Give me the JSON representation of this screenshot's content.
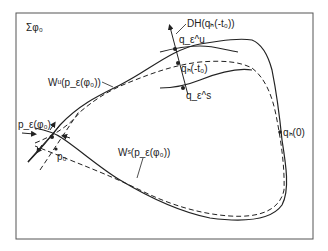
{
  "figure": {
    "section_label": "Σφ₀",
    "labels": {
      "dh": "DH(qₕ(-t₀))",
      "q_eps_u": "q_ε^u",
      "q_h_minus_t0": "qₕ(-t₀)",
      "q_eps_s": "q_ε^s",
      "w_unstable": "Wᵘ(p_ε(φ₀))",
      "w_stable": "Wˢ(p_ε(φ₀))",
      "p_eps": "p_ε(φ₀)",
      "p0": "p₀",
      "q_h_0": "qₕ(0)"
    },
    "colors": {
      "stroke": "#222222",
      "frame": "#555555",
      "background": "#ffffff"
    }
  }
}
